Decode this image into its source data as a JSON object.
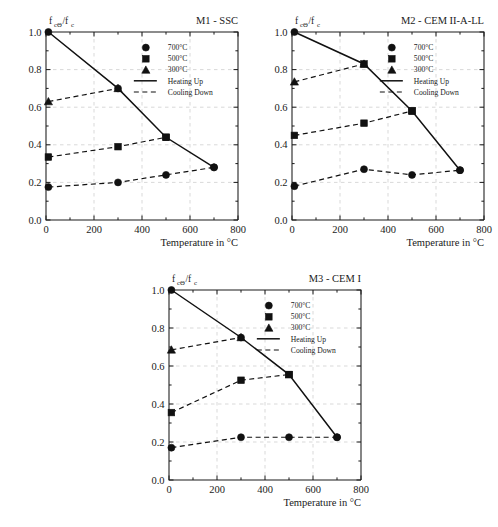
{
  "figure": {
    "panel_count": 3
  },
  "axis": {
    "x_title": "Temperature in °C",
    "y_label_main": "f",
    "y_label_sub": "cΘ",
    "y_label_main2": "/f",
    "y_label_sub2": "c",
    "x_ticks": [
      "0",
      "200",
      "400",
      "600",
      "800"
    ],
    "y_ticks": [
      "0.0",
      "0.2",
      "0.4",
      "0.6",
      "0.8",
      "1.0"
    ],
    "xlim": [
      0,
      800
    ],
    "ylim": [
      0,
      1.0
    ]
  },
  "legend": {
    "items": [
      {
        "label": "700°C",
        "marker": "circle"
      },
      {
        "label": "500°C",
        "marker": "square"
      },
      {
        "label": "300°C",
        "marker": "triangle"
      }
    ],
    "lines": [
      {
        "label": "Heating Up",
        "style": "solid"
      },
      {
        "label": "Cooling Down",
        "style": "dashed"
      }
    ]
  },
  "chart_data": [
    {
      "type": "line",
      "title": "M1 - SSC",
      "xlabel": "Temperature in °C",
      "ylabel": "fcΘ/fc",
      "xlim": [
        0,
        800
      ],
      "ylim": [
        0,
        1.0
      ],
      "grid": true,
      "legend_position": "upper-right-inside",
      "series": [
        {
          "name": "Heating Up",
          "style": "solid",
          "marker": "mixed",
          "x": [
            10,
            300,
            500,
            700
          ],
          "y": [
            1.0,
            0.7,
            0.44,
            0.28
          ],
          "point_markers": [
            "circle",
            "circle",
            "square",
            "circle"
          ]
        },
        {
          "name": "Cooling Down 300°C",
          "style": "dashed",
          "marker": "triangle",
          "x": [
            10,
            300
          ],
          "y": [
            0.63,
            0.7
          ]
        },
        {
          "name": "Cooling Down 500°C",
          "style": "dashed",
          "marker": "square",
          "x": [
            10,
            300,
            500
          ],
          "y": [
            0.335,
            0.39,
            0.44
          ]
        },
        {
          "name": "Cooling Down 700°C",
          "style": "dashed",
          "marker": "circle",
          "x": [
            10,
            300,
            500,
            700
          ],
          "y": [
            0.175,
            0.2,
            0.24,
            0.28
          ]
        }
      ]
    },
    {
      "type": "line",
      "title": "M2 - CEM II-A-LL",
      "xlabel": "Temperature in °C",
      "ylabel": "fcΘ/fc",
      "xlim": [
        0,
        800
      ],
      "ylim": [
        0,
        1.0
      ],
      "grid": true,
      "legend_position": "upper-right-inside",
      "series": [
        {
          "name": "Heating Up",
          "style": "solid",
          "marker": "mixed",
          "x": [
            10,
            300,
            500,
            700
          ],
          "y": [
            1.0,
            0.83,
            0.58,
            0.265
          ],
          "point_markers": [
            "circle",
            "square",
            "square",
            "circle"
          ]
        },
        {
          "name": "Cooling Down 300°C",
          "style": "dashed",
          "marker": "triangle",
          "x": [
            10,
            300
          ],
          "y": [
            0.735,
            0.83
          ]
        },
        {
          "name": "Cooling Down 500°C",
          "style": "dashed",
          "marker": "square",
          "x": [
            10,
            300,
            500
          ],
          "y": [
            0.45,
            0.515,
            0.58
          ]
        },
        {
          "name": "Cooling Down 700°C",
          "style": "dashed",
          "marker": "circle",
          "x": [
            10,
            300,
            500,
            700
          ],
          "y": [
            0.18,
            0.27,
            0.24,
            0.265
          ]
        }
      ]
    },
    {
      "type": "line",
      "title": "M3 - CEM I",
      "xlabel": "Temperature in °C",
      "ylabel": "fcΘ/fc",
      "xlim": [
        0,
        800
      ],
      "ylim": [
        0,
        1.0
      ],
      "grid": true,
      "legend_position": "upper-right-inside",
      "series": [
        {
          "name": "Heating Up",
          "style": "solid",
          "marker": "mixed",
          "x": [
            10,
            300,
            500,
            700
          ],
          "y": [
            1.0,
            0.75,
            0.555,
            0.225
          ],
          "point_markers": [
            "circle",
            "circle",
            "square",
            "circle"
          ]
        },
        {
          "name": "Cooling Down 300°C",
          "style": "dashed",
          "marker": "triangle",
          "x": [
            10,
            300
          ],
          "y": [
            0.685,
            0.75
          ]
        },
        {
          "name": "Cooling Down 500°C",
          "style": "dashed",
          "marker": "square",
          "x": [
            10,
            300,
            500
          ],
          "y": [
            0.355,
            0.525,
            0.555
          ]
        },
        {
          "name": "Cooling Down 700°C",
          "style": "dashed",
          "marker": "circle",
          "x": [
            10,
            300,
            500,
            700
          ],
          "y": [
            0.17,
            0.225,
            0.225,
            0.225
          ]
        }
      ]
    }
  ]
}
